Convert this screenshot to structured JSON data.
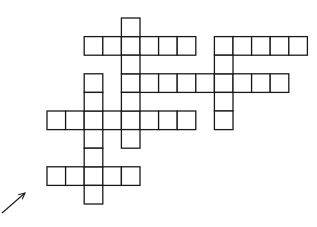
{
  "diagram": {
    "type": "crossword-grid",
    "background": "#ffffff",
    "line_color": "#1a1a1a",
    "grid": {
      "origin_x": 47,
      "origin_y": 18,
      "cell_size": 18.6
    },
    "words": [
      {
        "id": "across-top-left",
        "direction": "across",
        "row": 1,
        "col": 2,
        "length": 6
      },
      {
        "id": "across-top-right",
        "direction": "across",
        "row": 1,
        "col": 9,
        "length": 5
      },
      {
        "id": "across-middle",
        "direction": "across",
        "row": 3,
        "col": 4,
        "length": 9
      },
      {
        "id": "across-lower",
        "direction": "across",
        "row": 5,
        "col": 0,
        "length": 8
      },
      {
        "id": "across-bottom",
        "direction": "across",
        "row": 8,
        "col": 0,
        "length": 5
      },
      {
        "id": "down-center",
        "direction": "down",
        "row": 0,
        "col": 4,
        "length": 7
      },
      {
        "id": "down-right",
        "direction": "down",
        "row": 1,
        "col": 9,
        "length": 5
      },
      {
        "id": "down-left",
        "direction": "down",
        "row": 3,
        "col": 2,
        "length": 7
      }
    ],
    "arrow": {
      "from": [
        2,
        213
      ],
      "to": [
        25,
        193
      ],
      "direction": "up-right"
    }
  }
}
